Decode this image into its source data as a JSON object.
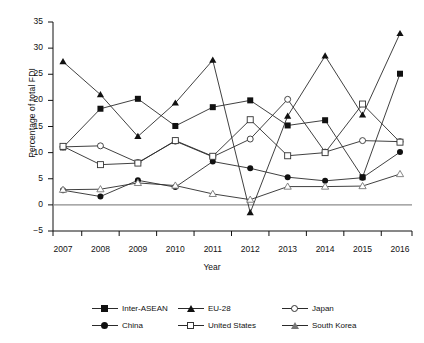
{
  "chart_data": {
    "type": "line",
    "title": "",
    "xlabel": "Year",
    "ylabel": "Percentage of total FDI",
    "categories": [
      "2007",
      "2008",
      "2009",
      "2010",
      "2011",
      "2012",
      "2013",
      "2014",
      "2015",
      "2016"
    ],
    "ylim": [
      -5,
      35
    ],
    "yticks": [
      -5,
      0,
      5,
      10,
      15,
      20,
      25,
      30,
      35
    ],
    "ytick_labels": [
      "−5",
      "0",
      "5",
      "10",
      "15",
      "20",
      "25",
      "30",
      "35"
    ],
    "grid": false,
    "legend_position": "bottom",
    "series": [
      {
        "name": "Inter-ASEAN",
        "marker": "filled-square",
        "values": [
          11.0,
          18.4,
          20.3,
          15.1,
          18.7,
          20.0,
          15.2,
          16.2,
          5.3,
          25.1
        ]
      },
      {
        "name": "EU-28",
        "marker": "filled-triangle",
        "values": [
          27.4,
          21.1,
          13.1,
          19.5,
          27.7,
          -1.5,
          17.0,
          28.5,
          17.2,
          32.8
        ]
      },
      {
        "name": "Japan",
        "marker": "open-circle",
        "values": [
          11.1,
          11.3,
          8.1,
          12.2,
          9.2,
          12.6,
          20.2,
          10.1,
          12.3,
          12.1
        ]
      },
      {
        "name": "China",
        "marker": "filled-circle",
        "values": [
          2.8,
          1.6,
          4.7,
          3.4,
          8.3,
          7.0,
          5.3,
          4.6,
          5.2,
          10.1
        ]
      },
      {
        "name": "United States",
        "marker": "open-square",
        "values": [
          11.2,
          7.7,
          8.0,
          12.3,
          9.3,
          16.3,
          9.4,
          10.0,
          19.3,
          12.0
        ]
      },
      {
        "name": "South Korea",
        "marker": "open-triangle",
        "values": [
          2.9,
          3.0,
          4.2,
          3.7,
          2.1,
          1.0,
          3.5,
          3.5,
          3.6,
          5.9
        ]
      }
    ],
    "colors": {
      "line": "#2b2b2b",
      "axis": "#111111",
      "zero_line": "#8c8c8c",
      "marker_open_edge": "#333333"
    }
  },
  "legend": {
    "entries": [
      {
        "label": "Inter-ASEAN",
        "marker": "filled-square"
      },
      {
        "label": "EU-28",
        "marker": "filled-triangle"
      },
      {
        "label": "Japan",
        "marker": "open-circle"
      },
      {
        "label": "China",
        "marker": "filled-circle"
      },
      {
        "label": "United States",
        "marker": "open-square"
      },
      {
        "label": "South Korea",
        "marker": "open-triangle"
      }
    ]
  }
}
